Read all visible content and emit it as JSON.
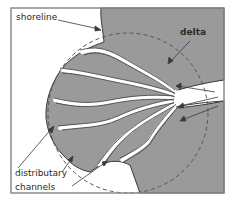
{
  "diagram": {
    "type": "river-delta",
    "labels": {
      "shoreline": "shoreline",
      "delta": "delta",
      "channels_line1": "distributary",
      "channels_line2": "channels"
    },
    "colors": {
      "sea": "#9a9a9a",
      "land": "#ffffff",
      "delta_lobe": "#9a9a9a",
      "outline": "#3a3a3a",
      "frame": "#8a8a8a",
      "dashed_circle": "#555555",
      "text": "#2a2a2a"
    }
  }
}
